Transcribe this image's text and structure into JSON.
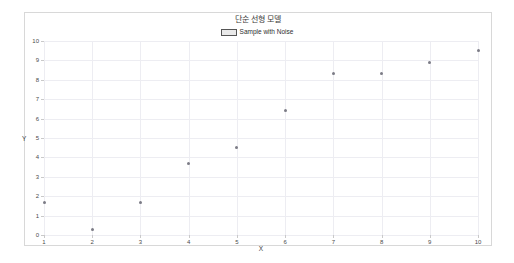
{
  "chart_data": {
    "type": "scatter",
    "title": "단순 선형 모델",
    "xlabel": "X",
    "ylabel": "Y",
    "xlim": [
      1,
      10
    ],
    "ylim": [
      0,
      10
    ],
    "grid": true,
    "legend_position": "top-center",
    "legend": [
      "Sample with Noise"
    ],
    "xticks": [
      "1",
      "2",
      "3",
      "4",
      "5",
      "6",
      "7",
      "8",
      "9",
      "10"
    ],
    "yticks": [
      "0",
      "1",
      "2",
      "3",
      "4",
      "5",
      "6",
      "7",
      "8",
      "9",
      "10"
    ],
    "series": [
      {
        "name": "Sample with Noise",
        "marker": "dot",
        "color": "#7c7c86",
        "x": [
          1,
          2,
          3,
          4,
          5,
          6,
          7,
          8,
          9,
          10
        ],
        "values": [
          1.7,
          0.3,
          1.7,
          3.7,
          4.5,
          6.4,
          8.3,
          8.3,
          8.9,
          9.5
        ]
      }
    ]
  },
  "colors": {
    "background": "#ffffff",
    "frame": "#d8d8d8",
    "gridline": "#ededf2",
    "axis": "#c9c9c9",
    "point": "#7c7c86",
    "text": "#3a3a3a",
    "legend_swatch_fill": "#e9e9e9",
    "legend_swatch_border": "#555555"
  }
}
